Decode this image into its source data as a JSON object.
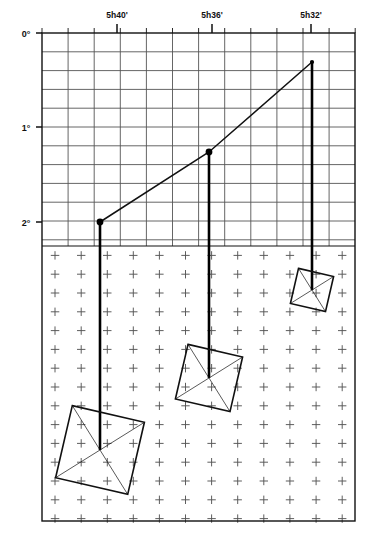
{
  "figure": {
    "title": ""
  },
  "chart_data": {
    "type": "scatter",
    "title": "",
    "subtitle": "",
    "xlabel": "",
    "ylabel": "",
    "x_axis": {
      "position": "top",
      "unit": "hours and minutes of right ascension",
      "direction": "decreasing left to right",
      "tick_labels": [
        "5h40'",
        "5h36'",
        "5h32'"
      ],
      "tick_x_px": [
        117,
        212,
        311
      ],
      "minor_tick_count": 12,
      "minor_tick_spacing_px": 26.1
    },
    "y_axis": {
      "position": "left",
      "unit": "degrees of declination",
      "direction": "increasing downward",
      "tick_labels": [
        "0°",
        "1°",
        "2°"
      ],
      "tick_y_px": [
        33,
        127,
        222
      ],
      "ylim": [
        0,
        2.6
      ],
      "minor_tick_spacing_px": 18.8
    },
    "grid": {
      "upper_region": "full rectangular ruled grid",
      "lower_region": "cross-mark (plus) grid",
      "divider_y_px": 246,
      "cell_width_px": 26.1,
      "cell_height_px": 18.8
    },
    "legend": {
      "visible": false,
      "position": "none"
    },
    "points": [
      {
        "label": "A",
        "ra": "5h40'",
        "dec_deg": 2.0,
        "x_px": 100,
        "y_px": 222
      },
      {
        "label": "B",
        "ra": "5h36'",
        "dec_deg": 1.26,
        "x_px": 209,
        "y_px": 152
      },
      {
        "label": "C",
        "ra": "5h32'",
        "dec_deg": 0.31,
        "x_px": 312,
        "y_px": 62
      }
    ],
    "connector_line": {
      "style": "solid",
      "vertices_px": [
        [
          100,
          222
        ],
        [
          209,
          152
        ],
        [
          312,
          62
        ]
      ]
    },
    "stems": [
      {
        "point": "A",
        "x_px": 100,
        "y_top_px": 222,
        "y_bottom_px": 450
      },
      {
        "point": "B",
        "x_px": 209,
        "y_top_px": 152,
        "y_bottom_px": 378
      },
      {
        "point": "C",
        "x_px": 312,
        "y_top_px": 62,
        "y_bottom_px": 290
      }
    ],
    "field_boxes": [
      {
        "point": "A",
        "center_px": [
          100,
          450
        ],
        "half_size_px": 37,
        "rotation_deg": 13
      },
      {
        "point": "B",
        "center_px": [
          209,
          378
        ],
        "half_size_px": 28,
        "rotation_deg": 13
      },
      {
        "point": "C",
        "center_px": [
          312,
          290
        ],
        "half_size_px": 18,
        "rotation_deg": 13
      }
    ]
  },
  "frame": {
    "left_px": 42,
    "top_px": 33,
    "right_px": 355,
    "bottom_px": 521
  },
  "colors": {
    "background": "#ffffff",
    "ink": "#111111",
    "grid": "#555555",
    "grid_light": "#888888",
    "marker": "#000000"
  }
}
